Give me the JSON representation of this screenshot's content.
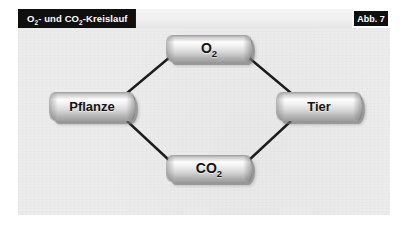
{
  "header": {
    "title_parts": {
      "o": "O",
      "o_sub": "2",
      "mid": "- und CO",
      "co_sub": "2",
      "tail": "-Kreislauf"
    },
    "title_plain": "O2- und CO2-Kreislauf",
    "figure_label": "Abb. 7"
  },
  "diagram": {
    "type": "cycle-diagram",
    "nodes": [
      {
        "id": "o2",
        "label": "O",
        "sub": "2",
        "position": "top"
      },
      {
        "id": "tier",
        "label": "Tier",
        "sub": "",
        "position": "right"
      },
      {
        "id": "co2",
        "label": "CO",
        "sub": "2",
        "position": "bottom"
      },
      {
        "id": "pflanze",
        "label": "Pflanze",
        "sub": "",
        "position": "left"
      }
    ],
    "edges": [
      {
        "from": "pflanze",
        "to": "o2"
      },
      {
        "from": "o2",
        "to": "tier"
      },
      {
        "from": "tier",
        "to": "co2"
      },
      {
        "from": "co2",
        "to": "pflanze"
      }
    ]
  },
  "colors": {
    "header_bar": "#100f0f",
    "header_text": "#ffffff",
    "panel_background": "#ececec",
    "node_text": "#151515",
    "edge_line": "#1c1c1c"
  }
}
